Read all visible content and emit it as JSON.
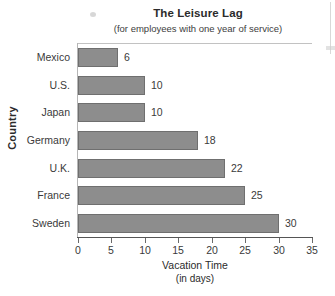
{
  "chart_data": {
    "type": "bar",
    "orientation": "horizontal",
    "title": "The Leisure Lag",
    "subtitle": "(for employees with one year of service)",
    "xlabel_line1": "Vacation Time",
    "xlabel_line2": "(in days)",
    "ylabel": "Country",
    "categories": [
      "Mexico",
      "U.S.",
      "Japan",
      "Germany",
      "U.K.",
      "France",
      "Sweden"
    ],
    "values": [
      6,
      10,
      10,
      18,
      22,
      25,
      30
    ],
    "value_labels": [
      "6",
      "10",
      "10",
      "18",
      "22",
      "25",
      "30"
    ],
    "xlim": [
      0,
      35
    ],
    "xticks": [
      0,
      5,
      10,
      15,
      20,
      25,
      30,
      35
    ],
    "xtick_labels": [
      "0",
      "5",
      "10",
      "15",
      "20",
      "25",
      "30",
      "35"
    ],
    "grid": false,
    "legend": false,
    "bar_color": "#8d8d8d",
    "bar_border_color": "#6f6f6f",
    "axis_color": "#555555",
    "text_color": "#3a3a3a",
    "background": "#ffffff"
  }
}
